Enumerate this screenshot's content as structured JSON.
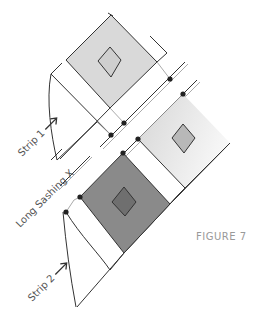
{
  "figure": {
    "caption": "FIGURE 7"
  },
  "labels": {
    "strip1": "Strip 1",
    "strip2": "Strip 2",
    "sashing": "Long Sashing X"
  },
  "colors": {
    "light_block": "#d9d9d9",
    "light_diamond": "#c9c9c9",
    "right_block_start": "#d6d6d6",
    "right_block_end": "#f5f5f5",
    "right_diamond": "#b4b4b4",
    "dark_block": "#8a8a8a",
    "dark_diamond": "#6f6f6f",
    "line": "#333333",
    "seam": "#aaaaaa",
    "dot": "#222222"
  },
  "blocks": [
    {
      "name": "top-light-block",
      "shade": "light"
    },
    {
      "name": "right-light-block",
      "shade": "gradient-light"
    },
    {
      "name": "bottom-dark-block",
      "shade": "dark"
    }
  ],
  "seam_dots": [
    {
      "x": 170,
      "y": 79
    },
    {
      "x": 183,
      "y": 94
    },
    {
      "x": 124,
      "y": 123
    },
    {
      "x": 111,
      "y": 135
    },
    {
      "x": 138,
      "y": 139
    },
    {
      "x": 123,
      "y": 153
    },
    {
      "x": 80,
      "y": 197
    },
    {
      "x": 66,
      "y": 212
    }
  ]
}
